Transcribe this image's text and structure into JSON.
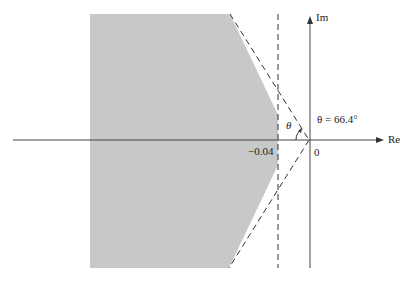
{
  "diagram": {
    "type": "s-plane region",
    "axes": {
      "real_label": "Re",
      "imag_label": "Im",
      "origin_label": "0"
    },
    "annotations": {
      "sigma_label": "−0.04",
      "theta_symbol": "θ",
      "theta_equation": "θ = 66.4°"
    },
    "colors": {
      "shaded_region": "#c8c8c8",
      "lines": "#333333"
    }
  }
}
